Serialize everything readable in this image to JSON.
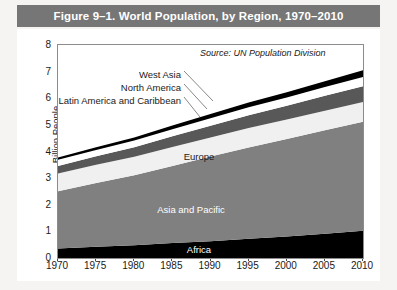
{
  "title": "Figure 9–1. World Population, by Region, 1970–2010",
  "source_note": "Source: UN Population Division",
  "colors": {
    "title_bar": "#767676",
    "card": "#ffffff",
    "page_background": "#f5f4f2",
    "axis": "#8c8c8c",
    "africa": "#000000",
    "asia_and_pacific": "#808080",
    "europe": "#f0f0f0",
    "latin_america_and_caribbean": "#585858",
    "north_america": "#ffffff",
    "west_asia": "#000000"
  },
  "callouts": {
    "west_asia": "West Asia",
    "north_america": "North America",
    "latin_america": "Latin America and Caribbean"
  },
  "band_labels": {
    "europe": "Europe",
    "asia_and_pacific": "Asia and Pacific",
    "africa": "Africa"
  },
  "chart_data": {
    "type": "area",
    "stacked": true,
    "title": "Figure 9–1. World Population, by Region, 1970–2010",
    "xlabel": "",
    "ylabel": "Billion People",
    "xlim": [
      1970,
      2010
    ],
    "ylim": [
      0,
      8
    ],
    "yticks": [
      0,
      1,
      2,
      3,
      4,
      5,
      6,
      7,
      8
    ],
    "xticks": [
      1970,
      1975,
      1980,
      1985,
      1990,
      1995,
      2000,
      2005,
      2010
    ],
    "grid": false,
    "legend": "inline-labels",
    "x": [
      1970,
      1975,
      1980,
      1985,
      1990,
      1995,
      2000,
      2005,
      2010
    ],
    "series": [
      {
        "name": "Africa",
        "color": "#000000",
        "values": [
          0.36,
          0.42,
          0.48,
          0.56,
          0.63,
          0.72,
          0.81,
          0.91,
          1.02
        ]
      },
      {
        "name": "Asia and Pacific",
        "color": "#808080",
        "values": [
          2.15,
          2.4,
          2.63,
          2.9,
          3.18,
          3.43,
          3.66,
          3.89,
          4.1
        ]
      },
      {
        "name": "Europe",
        "color": "#f0f0f0",
        "values": [
          0.66,
          0.68,
          0.69,
          0.71,
          0.72,
          0.73,
          0.73,
          0.73,
          0.74
        ]
      },
      {
        "name": "Latin America and Caribbean",
        "color": "#585858",
        "values": [
          0.29,
          0.32,
          0.36,
          0.4,
          0.44,
          0.48,
          0.52,
          0.56,
          0.59
        ]
      },
      {
        "name": "North America",
        "color": "#ffffff",
        "values": [
          0.23,
          0.24,
          0.25,
          0.27,
          0.28,
          0.3,
          0.31,
          0.33,
          0.35
        ]
      },
      {
        "name": "West Asia",
        "color": "#000000",
        "values": [
          0.08,
          0.1,
          0.12,
          0.14,
          0.16,
          0.18,
          0.2,
          0.22,
          0.25
        ]
      }
    ]
  }
}
